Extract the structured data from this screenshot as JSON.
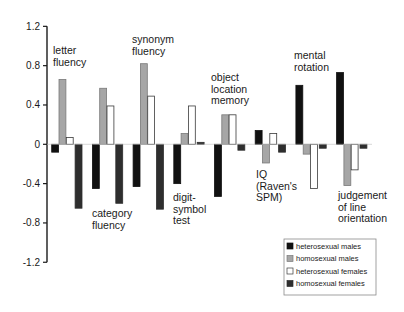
{
  "chart_data": {
    "type": "bar",
    "title": "",
    "xlabel": "",
    "ylabel": "",
    "ylim": [
      -1.2,
      1.2
    ],
    "yticks": [
      1.2,
      0.8,
      0.4,
      0,
      -0.4,
      -0.8,
      -1.2
    ],
    "ytick_labels": [
      "1.2",
      "0.8",
      "0.4",
      "0",
      "-0.4",
      "-0.8",
      "-1.2"
    ],
    "grid": false,
    "legend_position": "lower right",
    "categories": [
      "letter fluency",
      "category fluency",
      "synonym fluency",
      "digit-symbol test",
      "object location memory",
      "IQ (Raven's SPM)",
      "mental rotation",
      "judgement of line orientation"
    ],
    "category_labels": [
      {
        "lines": [
          "letter",
          "fluency"
        ],
        "x": 53,
        "y": 54
      },
      {
        "lines": [
          "category",
          "fluency"
        ],
        "x": 92,
        "y": 217
      },
      {
        "lines": [
          "synonym",
          "fluency"
        ],
        "x": 132,
        "y": 43
      },
      {
        "lines": [
          "digit-",
          "symbol",
          "test"
        ],
        "x": 173,
        "y": 201
      },
      {
        "lines": [
          "object",
          "location",
          "memory"
        ],
        "x": 211,
        "y": 81
      },
      {
        "lines": [
          "IQ",
          "(Raven's",
          "SPM)"
        ],
        "x": 256,
        "y": 178
      },
      {
        "lines": [
          "mental",
          "rotation"
        ],
        "x": 294,
        "y": 59
      },
      {
        "lines": [
          "judgement",
          "of line",
          "orientation"
        ],
        "x": 338,
        "y": 199
      }
    ],
    "series": [
      {
        "name": "heterosexual males",
        "color": "#111111",
        "stroke": "#111111",
        "values": [
          -0.08,
          -0.45,
          -0.43,
          -0.4,
          -0.53,
          0.14,
          0.6,
          0.73
        ]
      },
      {
        "name": "homosexual males",
        "color": "#a6a6a6",
        "stroke": "#7a7a7a",
        "values": [
          0.66,
          0.57,
          0.82,
          0.11,
          0.3,
          -0.19,
          -0.1,
          -0.42
        ]
      },
      {
        "name": "heterosexual females",
        "color": "#ffffff",
        "stroke": "#3a3a3a",
        "values": [
          0.07,
          0.39,
          0.49,
          0.39,
          0.3,
          0.11,
          -0.45,
          -0.26
        ]
      },
      {
        "name": "homosexual females",
        "color": "#2e2e2e",
        "stroke": "#2e2e2e",
        "values": [
          -0.65,
          -0.6,
          -0.66,
          0.02,
          -0.06,
          -0.08,
          -0.04,
          -0.04
        ]
      }
    ]
  },
  "legend": {
    "items": [
      {
        "label": "heterosexual males",
        "swatch": "#111111",
        "border": "#111111"
      },
      {
        "label": "homosexual males",
        "swatch": "#a6a6a6",
        "border": "#7a7a7a"
      },
      {
        "label": "heterosexual females",
        "swatch": "#ffffff",
        "border": "#3a3a3a"
      },
      {
        "label": "homosexual females",
        "swatch": "#2e2e2e",
        "border": "#2e2e2e"
      }
    ]
  },
  "layout": {
    "axis_x": 47,
    "zero_y": 144.3,
    "px_per_unit": 98.3,
    "group_start_x": 51.7,
    "group_spacing": 40.7,
    "bar_width": 7.3,
    "dark_bar_gap": 1.5,
    "axis_color": "#1a1a1a"
  }
}
